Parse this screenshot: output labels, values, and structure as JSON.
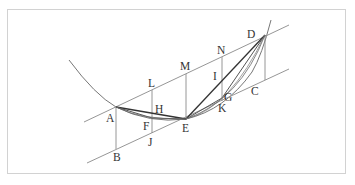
{
  "diagram": {
    "type": "geometric construction (parabola with chords and parallel tangents)",
    "points": {
      "A": {
        "label": "A",
        "x": 116,
        "y": 107
      },
      "B": {
        "label": "B",
        "x": 116,
        "y": 149
      },
      "C": {
        "label": "C",
        "x": 265,
        "y": 80
      },
      "D": {
        "label": "D",
        "x": 265,
        "y": 35
      },
      "E": {
        "label": "E",
        "x": 186,
        "y": 119
      },
      "F": {
        "label": "F",
        "x": 152,
        "y": 118
      },
      "G": {
        "label": "G",
        "x": 222,
        "y": 98
      },
      "H": {
        "label": "H",
        "x": 152,
        "y": 114
      },
      "I": {
        "label": "I",
        "x": 222,
        "y": 80
      },
      "J": {
        "label": "J",
        "x": 152,
        "y": 133
      },
      "K": {
        "label": "K",
        "x": 222,
        "y": 101
      },
      "L": {
        "label": "L",
        "x": 152,
        "y": 90
      },
      "M": {
        "label": "M",
        "x": 186,
        "y": 74
      },
      "N": {
        "label": "N",
        "x": 222,
        "y": 57
      }
    },
    "labels": [
      "A",
      "B",
      "C",
      "D",
      "E",
      "F",
      "G",
      "H",
      "I",
      "J",
      "K",
      "L",
      "M",
      "N"
    ],
    "colors": {
      "frame": "#d2d2d2",
      "thin_line": "#8a8a8a",
      "curve": "#777777",
      "chord": "#333333",
      "text": "#333333"
    }
  }
}
